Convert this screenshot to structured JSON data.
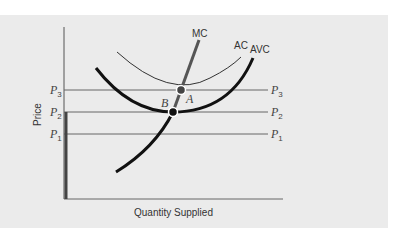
{
  "diagram": {
    "axes": {
      "ylabel": "Price",
      "xlabel": "Quantity Supplied"
    },
    "price_levels": [
      {
        "base": "P",
        "sub": "3",
        "y": 90
      },
      {
        "base": "P",
        "sub": "2",
        "y": 112
      },
      {
        "base": "P",
        "sub": "1",
        "y": 134
      }
    ],
    "curves": {
      "mc": {
        "label": "MC"
      },
      "ac": {
        "label": "AC"
      },
      "avc": {
        "label": "AVC"
      }
    },
    "points": {
      "a": {
        "label": "A"
      },
      "b": {
        "label": "B"
      }
    },
    "colors": {
      "panel": "#ebebeb",
      "mc": "#555555",
      "curve": "#111111",
      "axis": "#555555"
    }
  }
}
